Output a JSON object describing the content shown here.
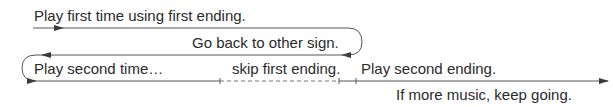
{
  "labels": {
    "first_time": "Play first time using first ending.",
    "go_back": "Go back to other sign.",
    "second_time": "Play second time…",
    "skip_first": "skip first ending.",
    "second_ending": "Play second ending.",
    "keep_going": "If more music, keep going."
  },
  "colors": {
    "line": "#3a3a3a",
    "text": "#2a2a2a"
  }
}
